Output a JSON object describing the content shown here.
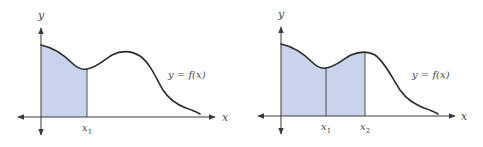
{
  "colors": {
    "background": "#ffffff",
    "curve": "#2a2a2a",
    "axis": "#3a3a3a",
    "shade": "#c9d3ec",
    "text": "#4a4a4a"
  },
  "panels": [
    {
      "id": "left",
      "axis_label_y": "y",
      "axis_label_x": "x",
      "function_label": "y = f(x)",
      "markers": [
        {
          "label": "x",
          "subscript": "1"
        }
      ],
      "shaded_regions": 1
    },
    {
      "id": "right",
      "axis_label_y": "y",
      "axis_label_x": "x",
      "function_label": "y = f(x)",
      "markers": [
        {
          "label": "x",
          "subscript": "1"
        },
        {
          "label": "x",
          "subscript": "2"
        }
      ],
      "shaded_regions": 2
    }
  ]
}
